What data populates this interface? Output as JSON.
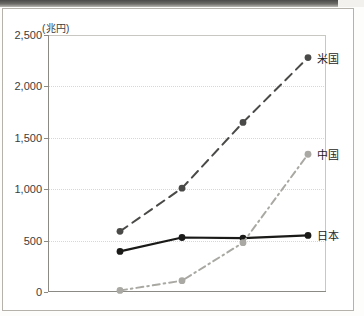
{
  "axis": {
    "unit_label": "(兆円)",
    "y_ticks": [
      "2,500",
      "2,000",
      "1,500",
      "1,000",
      "500",
      "0"
    ],
    "y_min": 0,
    "y_max": 2500
  },
  "series_labels": {
    "usa": "米国",
    "china": "中国",
    "japan": "日本"
  },
  "colors": {
    "usa": "#4a4a48",
    "china": "#a9a8a2",
    "japan": "#1a1a19",
    "grid": "#d8d5e2",
    "axis": "#8c8a84",
    "frame": "#b4b2ab",
    "text": "#3d3c3a"
  },
  "chart_data": {
    "type": "line",
    "title": "",
    "xlabel": "",
    "ylabel": "(兆円)",
    "ylim": [
      0,
      2500
    ],
    "yticks": [
      0,
      500,
      1000,
      1500,
      2000,
      2500
    ],
    "grid": true,
    "legend_position": "right-inline",
    "x": [
      1,
      2,
      3,
      4
    ],
    "xticklabels": [
      "",
      "",
      "",
      ""
    ],
    "series": [
      {
        "name": "米国",
        "key": "usa",
        "style": "dashed",
        "color": "#4a4a48",
        "values": [
          590,
          1010,
          1650,
          2280
        ]
      },
      {
        "name": "日本",
        "key": "japan",
        "style": "solid",
        "color": "#1a1a19",
        "values": [
          395,
          530,
          525,
          550
        ]
      },
      {
        "name": "中国",
        "key": "china",
        "style": "dashdot",
        "color": "#a9a8a2",
        "values": [
          15,
          110,
          480,
          1340
        ]
      }
    ]
  }
}
